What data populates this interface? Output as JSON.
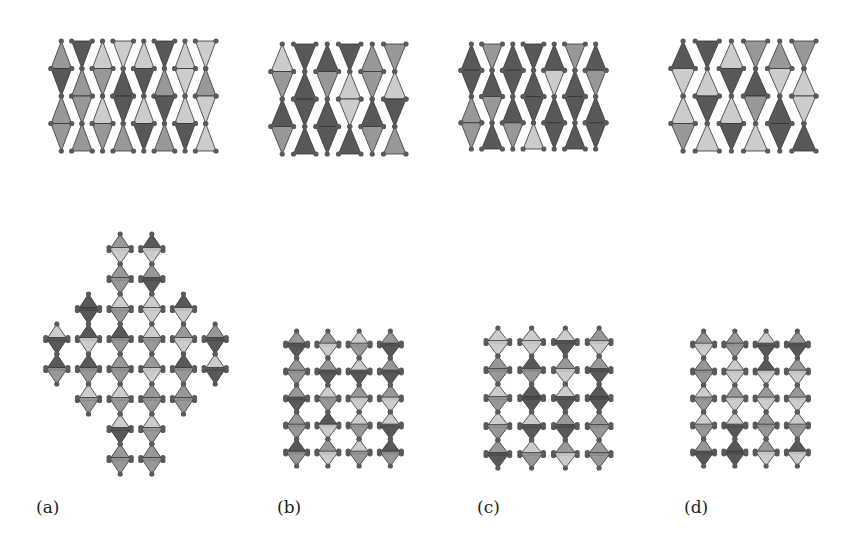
{
  "figure": {
    "panels": [
      {
        "id": "a",
        "label": "(a)"
      },
      {
        "id": "b",
        "label": "(b)"
      },
      {
        "id": "c",
        "label": "(c)"
      },
      {
        "id": "d",
        "label": "(d)"
      }
    ],
    "colors": {
      "light": "#c8c8c8",
      "mid": "#8f8f8f",
      "dark": "#4a4a4a",
      "node": "#5a5a5a",
      "background": "#ffffff"
    }
  }
}
